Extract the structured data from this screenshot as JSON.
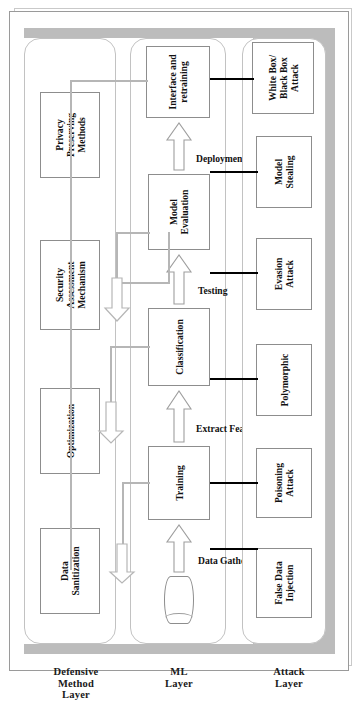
{
  "figure": {
    "orientation": "rotated-90-ccw",
    "colors": {
      "band": "#bcbcbc",
      "node_border": "#8d8d8d",
      "attack_link": "#000000",
      "defense_link": "#b6b6b6",
      "layer_border": "#c2c2c2",
      "background": "#ffffff"
    }
  },
  "layers": [
    {
      "id": "defensive",
      "label": "Defensive\nMethod\nLayer"
    },
    {
      "id": "ml",
      "label": "ML\nLayer"
    },
    {
      "id": "attack",
      "label": "Attack\nLayer"
    }
  ],
  "defensive_layer": {
    "label": "Defensive Method Layer",
    "nodes": [
      {
        "id": "data-sanitization",
        "label": "Data\nSanitization"
      },
      {
        "id": "optimization",
        "label": "Optimization"
      },
      {
        "id": "security-assessment",
        "label": "Security\nAssessment\nMechanism"
      },
      {
        "id": "privacy-preserving",
        "label": "Privacy\nPreserving\nMethods"
      }
    ]
  },
  "ml_layer": {
    "label": "ML Layer",
    "datastore": {
      "id": "data-store",
      "label": ""
    },
    "nodes": [
      {
        "id": "training",
        "label": "Training"
      },
      {
        "id": "classification",
        "label": "Classification"
      },
      {
        "id": "model-evaluation",
        "label": "Model\nEvaluation"
      },
      {
        "id": "interface-retraining",
        "label": "Interface and\nretraining"
      }
    ],
    "edges": [
      {
        "id": "data-gathering",
        "label": "Data Gathering"
      },
      {
        "id": "extract-features",
        "label": "Extract Features"
      },
      {
        "id": "testing",
        "label": "Testing"
      },
      {
        "id": "deployment",
        "label": "Deployment"
      }
    ]
  },
  "attack_layer": {
    "label": "Attack Layer",
    "nodes": [
      {
        "id": "false-data-injection",
        "label": "False Data\nInjection"
      },
      {
        "id": "poisoning-attack",
        "label": "Poisoning\nAttack"
      },
      {
        "id": "polymorphic",
        "label": "Polymorphic"
      },
      {
        "id": "evasion-attack",
        "label": "Evasion\nAttack"
      },
      {
        "id": "model-stealing",
        "label": "Model\nStealing"
      },
      {
        "id": "whitebox-blackbox",
        "label": "White Box/\nBlack Box\nAttack"
      }
    ]
  }
}
